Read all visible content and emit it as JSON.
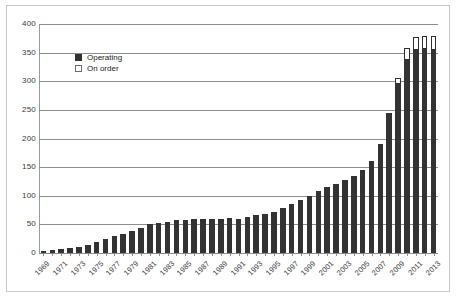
{
  "chart_data": {
    "type": "bar",
    "title": "",
    "subtitle": "",
    "xlabel": "",
    "ylabel": "",
    "ylim": [
      0,
      400
    ],
    "ytick_labels": [
      "400",
      "350",
      "300",
      "250",
      "200",
      "150",
      "100",
      "50",
      "0"
    ],
    "ytick_values": [
      400,
      350,
      300,
      250,
      200,
      150,
      100,
      50,
      0
    ],
    "grid": true,
    "legend_position": "upper-left-inside",
    "stacked": true,
    "categories": [
      "1969",
      "1970",
      "1971",
      "1972",
      "1973",
      "1974",
      "1975",
      "1976",
      "1977",
      "1978",
      "1979",
      "1980",
      "1981",
      "1982",
      "1983",
      "1984",
      "1985",
      "1986",
      "1987",
      "1988",
      "1989",
      "1990",
      "1991",
      "1992",
      "1993",
      "1994",
      "1995",
      "1996",
      "1997",
      "1998",
      "1999",
      "2000",
      "2001",
      "2002",
      "2003",
      "2004",
      "2005",
      "2006",
      "2007",
      "2008",
      "2009",
      "2010",
      "2011",
      "2012",
      "2013"
    ],
    "xtick_labels": [
      "1969",
      "1971",
      "1973",
      "1975",
      "1977",
      "1979",
      "1981",
      "1983",
      "1985",
      "1987",
      "1989",
      "1991",
      "1993",
      "1995",
      "1997",
      "1999",
      "2001",
      "2003",
      "2005",
      "2007",
      "2009",
      "2011",
      "2013"
    ],
    "series": [
      {
        "name": "Operating",
        "color": "#333333",
        "values": [
          3,
          5,
          7,
          8,
          10,
          14,
          19,
          24,
          30,
          33,
          38,
          43,
          50,
          52,
          55,
          58,
          58,
          59,
          59,
          60,
          60,
          62,
          60,
          63,
          66,
          69,
          72,
          78,
          85,
          92,
          100,
          108,
          116,
          120,
          127,
          134,
          145,
          160,
          190,
          245,
          295,
          338,
          355,
          357,
          355
        ]
      },
      {
        "name": "On order",
        "color": "#ffffff",
        "values": [
          0,
          0,
          0,
          0,
          0,
          0,
          0,
          0,
          0,
          0,
          0,
          0,
          0,
          0,
          0,
          0,
          0,
          0,
          0,
          0,
          0,
          0,
          0,
          0,
          0,
          0,
          0,
          0,
          0,
          0,
          0,
          0,
          0,
          0,
          0,
          0,
          0,
          0,
          0,
          0,
          10,
          20,
          22,
          22,
          24
        ]
      }
    ]
  },
  "legend": {
    "items": [
      {
        "label": "Operating"
      },
      {
        "label": "On order"
      }
    ]
  }
}
